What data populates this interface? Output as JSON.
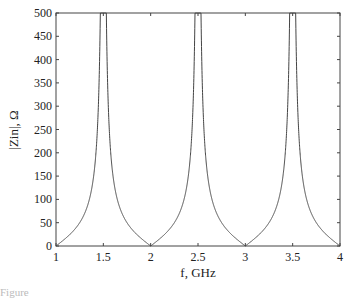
{
  "chart_data": {
    "type": "line",
    "title": "",
    "xlabel": "f, GHz",
    "ylabel": "|Zin|, Ω",
    "xlim": [
      1,
      4
    ],
    "ylim": [
      0,
      500
    ],
    "xticks": [
      "1",
      "1.5",
      "2",
      "2.5",
      "3",
      "3.5",
      "4"
    ],
    "yticks": [
      "0",
      "50",
      "100",
      "150",
      "200",
      "250",
      "300",
      "350",
      "400",
      "450",
      "500"
    ],
    "grid": false,
    "legend": null,
    "series": [
      {
        "name": "|Zin|",
        "x": [
          1.0,
          1.1,
          1.2,
          1.25,
          1.3,
          1.4,
          1.45,
          1.47,
          1.49,
          1.5,
          1.51,
          1.53,
          1.55,
          1.6,
          1.7,
          1.75,
          1.8,
          1.9,
          2.0,
          2.1,
          2.2,
          2.25,
          2.3,
          2.4,
          2.45,
          2.47,
          2.49,
          2.5,
          2.51,
          2.53,
          2.55,
          2.6,
          2.7,
          2.75,
          2.8,
          2.9,
          3.0,
          3.1,
          3.2,
          3.25,
          3.3,
          3.4,
          3.45,
          3.47,
          3.49,
          3.5,
          3.51,
          3.53,
          3.55,
          3.6,
          3.7,
          3.75,
          3.8,
          3.9,
          4.0
        ],
        "y": [
          0,
          16,
          36,
          50,
          69,
          154,
          316,
          500,
          500,
          500,
          500,
          500,
          316,
          154,
          69,
          50,
          36,
          16,
          0,
          16,
          36,
          50,
          69,
          154,
          316,
          500,
          500,
          500,
          500,
          500,
          316,
          154,
          69,
          50,
          36,
          16,
          0,
          16,
          36,
          50,
          69,
          154,
          316,
          500,
          500,
          500,
          500,
          500,
          316,
          154,
          69,
          50,
          36,
          16,
          0
        ]
      }
    ]
  },
  "caption_fragment": "Figure"
}
